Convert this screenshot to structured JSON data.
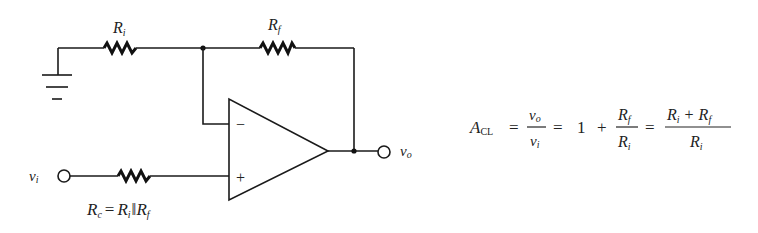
{
  "diagram": {
    "type": "non-inverting op-amp amplifier",
    "components": {
      "input_resistor": {
        "symbol": "R",
        "sub": "i"
      },
      "feedback_resistor": {
        "symbol": "R",
        "sub": "f"
      },
      "compensating_resistor": {
        "symbol": "R",
        "sub": "c"
      },
      "opamp": {
        "inverting": "−",
        "noninverting": "+"
      }
    },
    "terminals": {
      "input": {
        "symbol": "v",
        "sub": "i"
      },
      "output": {
        "symbol": "v",
        "sub": "o"
      }
    },
    "rc_relation": {
      "lhs": "R",
      "lhs_sub": "c",
      "eq": "=",
      "a": "R",
      "a_sub": "i",
      "parallel": "‖",
      "b": "R",
      "b_sub": "f"
    },
    "gain_formula": {
      "lhs": "A",
      "lhs_sub": "CL",
      "eq1": "=",
      "frac1_num": "v",
      "frac1_num_sub": "o",
      "frac1_den": "v",
      "frac1_den_sub": "i",
      "eq2": "=",
      "one": "1",
      "plus": "+",
      "frac2_num": "R",
      "frac2_num_sub": "f",
      "frac2_den": "R",
      "frac2_den_sub": "i",
      "eq3": "=",
      "frac3_num_a": "R",
      "frac3_num_a_sub": "i",
      "frac3_plus": "+",
      "frac3_num_b": "R",
      "frac3_num_b_sub": "f",
      "frac3_den": "R",
      "frac3_den_sub": "i"
    }
  }
}
